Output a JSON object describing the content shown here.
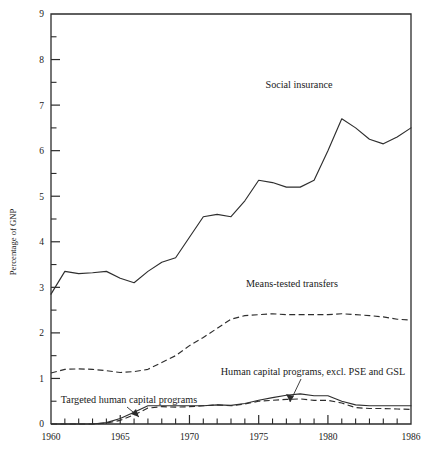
{
  "chart_data": {
    "type": "line",
    "title": "",
    "xlabel": "",
    "ylabel": "Percentage of GNP",
    "xlim": [
      1960,
      1986
    ],
    "ylim": [
      0,
      9
    ],
    "grid": false,
    "legend_position": "inline-annotations",
    "y_ticks_major": [
      "0",
      "1",
      "2",
      "3",
      "4",
      "5",
      "6",
      "7",
      "8",
      "9"
    ],
    "y_ticks_minor": [
      0.5,
      1.5,
      2.5,
      3.5,
      4.5,
      5.5,
      6.5,
      7.5,
      8.5
    ],
    "x_ticks_major": [
      "1960",
      "1965",
      "1970",
      "1975",
      "1980",
      "1986"
    ],
    "x_ticks_minor": [
      1961,
      1962,
      1963,
      1964,
      1966,
      1967,
      1968,
      1969,
      1971,
      1972,
      1973,
      1974,
      1976,
      1977,
      1978,
      1979,
      1981,
      1982,
      1983,
      1984,
      1985
    ],
    "x": [
      1960,
      1961,
      1962,
      1963,
      1964,
      1965,
      1966,
      1967,
      1968,
      1969,
      1970,
      1971,
      1972,
      1973,
      1974,
      1975,
      1976,
      1977,
      1978,
      1979,
      1980,
      1981,
      1982,
      1983,
      1984,
      1985,
      1986
    ],
    "series": [
      {
        "name": "Social insurance",
        "style": "solid",
        "label": "Social insurance",
        "values": [
          2.85,
          3.35,
          3.3,
          3.32,
          3.35,
          3.2,
          3.1,
          3.35,
          3.55,
          3.65,
          4.1,
          4.55,
          4.6,
          4.55,
          4.9,
          5.35,
          5.3,
          5.2,
          5.2,
          5.35,
          6.0,
          6.7,
          6.5,
          6.25,
          6.15,
          6.3,
          6.5
        ]
      },
      {
        "name": "Means-tested transfers",
        "style": "dashed",
        "label": "Means-tested transfers",
        "values": [
          1.12,
          1.2,
          1.21,
          1.2,
          1.17,
          1.13,
          1.15,
          1.2,
          1.35,
          1.5,
          1.72,
          1.9,
          2.1,
          2.3,
          2.38,
          2.4,
          2.42,
          2.4,
          2.4,
          2.4,
          2.4,
          2.42,
          2.4,
          2.38,
          2.35,
          2.3,
          2.28
        ]
      },
      {
        "name": "Human capital programs, excl. PSE and GSL",
        "style": "dashed",
        "label": "Human capital programs, excl. PSE and GSL",
        "values": [
          0.0,
          0.0,
          0.0,
          0.0,
          0.02,
          0.08,
          0.2,
          0.35,
          0.38,
          0.37,
          0.38,
          0.4,
          0.42,
          0.4,
          0.44,
          0.5,
          0.52,
          0.54,
          0.55,
          0.52,
          0.52,
          0.46,
          0.36,
          0.34,
          0.34,
          0.33,
          0.32
        ]
      },
      {
        "name": "Targeted human capital programs",
        "style": "solid",
        "label": "Targeted human capital programs",
        "values": [
          0.0,
          0.0,
          0.0,
          0.0,
          0.03,
          0.12,
          0.26,
          0.4,
          0.4,
          0.4,
          0.4,
          0.4,
          0.42,
          0.41,
          0.45,
          0.52,
          0.58,
          0.63,
          0.66,
          0.62,
          0.62,
          0.5,
          0.42,
          0.4,
          0.4,
          0.4,
          0.4
        ]
      }
    ],
    "annotations": [
      {
        "name": "social-insurance-label",
        "text": "Social insurance",
        "x": 299,
        "y": 88,
        "anchor": "middle",
        "leader": false
      },
      {
        "name": "means-tested-transfers-label",
        "text": "Means-tested transfers",
        "x": 292,
        "y": 287,
        "anchor": "middle",
        "leader": false
      },
      {
        "name": "human-capital-excl-label",
        "text": "Human capital programs, excl. PSE and GSL",
        "x": 313,
        "y": 375,
        "anchor": "middle",
        "leader": true
      },
      {
        "name": "targeted-human-capital-label",
        "text": "Targeted human capital programs",
        "x": 129,
        "y": 403,
        "anchor": "middle",
        "leader": true
      }
    ],
    "colors": {
      "line": "#2e2e2e",
      "axis": "#2b2b2b",
      "text": "#1a1a1a",
      "background": "#ffffff"
    }
  }
}
